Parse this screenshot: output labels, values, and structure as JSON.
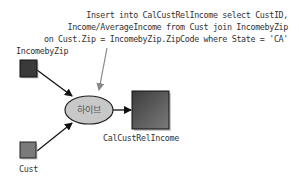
{
  "annotation": {
    "lines": [
      "Insert into CalCustRelIncome select CustID,",
      "Income/AverageIncome from Cust join IncomebyZip",
      "on Cust.Zip = IncomebyZip.ZipCode where State = 'CA'"
    ]
  },
  "nodes": {
    "incomebyzip": {
      "label": "IncomebyZip",
      "type": "table",
      "color": "#3a3a3a"
    },
    "cust": {
      "label": "Cust",
      "type": "table",
      "color": "#7a7a7a"
    },
    "hive": {
      "label": "하이브",
      "type": "process",
      "color": "#c8c8c8"
    },
    "output": {
      "label": "CalCustRelIncome",
      "type": "table",
      "color": "#4a4a4a"
    }
  },
  "edges": [
    {
      "from": "IncomebyZip",
      "to": "하이브"
    },
    {
      "from": "Cust",
      "to": "하이브"
    },
    {
      "from": "하이브",
      "to": "CalCustRelIncome"
    }
  ]
}
